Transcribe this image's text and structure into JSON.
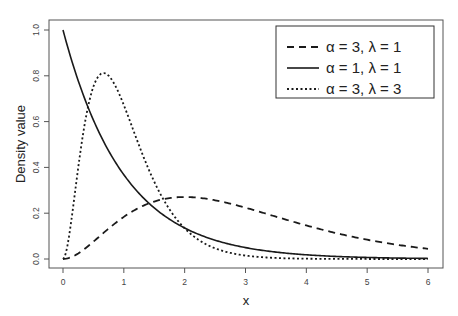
{
  "chart_data": {
    "type": "line",
    "title": "",
    "xlabel": "x",
    "ylabel": "Density value",
    "xlim": [
      0,
      6
    ],
    "ylim": [
      0,
      1.0
    ],
    "x_ticks": [
      "0",
      "1",
      "2",
      "3",
      "4",
      "5",
      "6"
    ],
    "y_ticks": [
      "0.0",
      "0.2",
      "0.4",
      "0.6",
      "0.8",
      "1.0"
    ],
    "grid": false,
    "legend_position": "top-right",
    "x": [
      0,
      0.25,
      0.5,
      0.667,
      1,
      1.5,
      2,
      2.5,
      3,
      4,
      5,
      6
    ],
    "series": [
      {
        "name": "α = 3, λ = 1",
        "style": "dashed",
        "shape": 3,
        "rate": 1,
        "values": [
          0.0,
          0.024,
          0.076,
          0.114,
          0.184,
          0.251,
          0.271,
          0.257,
          0.224,
          0.147,
          0.084,
          0.045
        ]
      },
      {
        "name": "α = 1, λ = 1",
        "style": "solid",
        "shape": 1,
        "rate": 1,
        "values": [
          1.0,
          0.779,
          0.607,
          0.513,
          0.368,
          0.223,
          0.135,
          0.082,
          0.05,
          0.018,
          0.007,
          0.002
        ]
      },
      {
        "name": "α = 3, λ = 3",
        "style": "dotted",
        "shape": 3,
        "rate": 3,
        "values": [
          0.0,
          0.398,
          0.753,
          0.812,
          0.672,
          0.337,
          0.134,
          0.047,
          0.015,
          0.001,
          0.0,
          0.0
        ]
      }
    ]
  },
  "legend": {
    "items": [
      {
        "label": "α = 3, λ = 1",
        "style": "dashed"
      },
      {
        "label": "α = 1, λ = 1",
        "style": "solid"
      },
      {
        "label": "α = 3, λ = 3",
        "style": "dotted"
      }
    ]
  },
  "axes": {
    "xlabel": "x",
    "ylabel": "Density value"
  },
  "colors": {
    "line": "#1a1a1a",
    "frame": "#555555",
    "background": "#ffffff"
  }
}
